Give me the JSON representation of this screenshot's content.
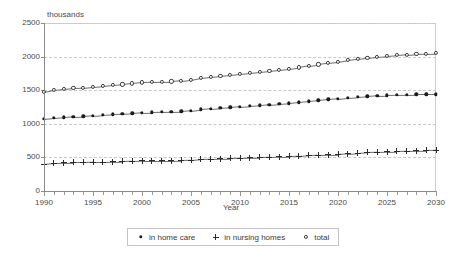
{
  "chart_data": {
    "type": "line",
    "title": "",
    "units_label": "thousands",
    "xlabel": "Year",
    "ylabel": "",
    "xlim": [
      1990,
      2030
    ],
    "ylim": [
      0,
      2500
    ],
    "yticks": [
      0,
      500,
      1000,
      1500,
      2000,
      2500
    ],
    "xticks": [
      1990,
      1995,
      2000,
      2005,
      2010,
      2015,
      2020,
      2025,
      2030
    ],
    "xtick_step": 1,
    "grid": "horizontal-dashed",
    "legend_position": "bottom-center",
    "x": [
      1990,
      1991,
      1992,
      1993,
      1994,
      1995,
      1996,
      1997,
      1998,
      1999,
      2000,
      2001,
      2002,
      2003,
      2004,
      2005,
      2006,
      2007,
      2008,
      2009,
      2010,
      2011,
      2012,
      2013,
      2014,
      2015,
      2016,
      2017,
      2018,
      2019,
      2020,
      2021,
      2022,
      2023,
      2024,
      2025,
      2026,
      2027,
      2028,
      2029,
      2030
    ],
    "series": [
      {
        "name": "in home care",
        "marker": "filled-circle",
        "values": [
          1070,
          1085,
          1095,
          1105,
          1110,
          1120,
          1130,
          1140,
          1145,
          1155,
          1165,
          1170,
          1175,
          1180,
          1185,
          1195,
          1215,
          1225,
          1235,
          1245,
          1255,
          1265,
          1275,
          1285,
          1295,
          1305,
          1320,
          1335,
          1350,
          1365,
          1375,
          1390,
          1400,
          1410,
          1420,
          1425,
          1430,
          1435,
          1440,
          1440,
          1440
        ]
      },
      {
        "name": "in nursing homes",
        "marker": "plus",
        "values": [
          400,
          415,
          420,
          425,
          425,
          430,
          430,
          435,
          440,
          445,
          450,
          450,
          450,
          450,
          455,
          460,
          470,
          475,
          480,
          485,
          490,
          495,
          500,
          505,
          510,
          515,
          520,
          530,
          535,
          540,
          545,
          555,
          565,
          575,
          580,
          585,
          590,
          595,
          600,
          605,
          610
        ]
      },
      {
        "name": "total",
        "marker": "open-circle",
        "values": [
          1470,
          1500,
          1515,
          1530,
          1535,
          1550,
          1560,
          1575,
          1585,
          1600,
          1615,
          1620,
          1625,
          1630,
          1640,
          1655,
          1685,
          1700,
          1715,
          1730,
          1745,
          1760,
          1775,
          1790,
          1805,
          1820,
          1840,
          1865,
          1885,
          1905,
          1920,
          1945,
          1965,
          1985,
          2000,
          2010,
          2020,
          2030,
          2040,
          2045,
          2050
        ]
      }
    ]
  },
  "legend": {
    "items": [
      {
        "label": "in home care",
        "marker": "filled-circle"
      },
      {
        "label": "in nursing homes",
        "marker": "plus"
      },
      {
        "label": "total",
        "marker": "open-circle"
      }
    ]
  }
}
